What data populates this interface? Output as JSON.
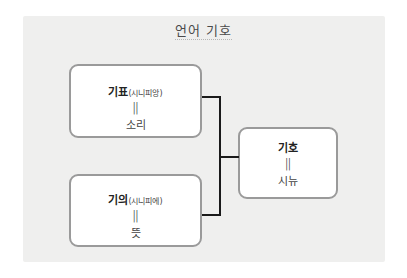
{
  "diagram": {
    "title": "언어 기호",
    "signifier": {
      "label": "기표",
      "sub": "(시니피앙)",
      "equals": "||",
      "value": "소리"
    },
    "signified": {
      "label": "기의",
      "sub": "(시니피에)",
      "equals": "||",
      "value": "뜻"
    },
    "sign": {
      "label": "기호",
      "equals": "||",
      "value": "시뉴"
    },
    "colors": {
      "panel_background": "#efefee",
      "box_border": "#9a9a9a",
      "connector": "#1a1a1a"
    }
  }
}
